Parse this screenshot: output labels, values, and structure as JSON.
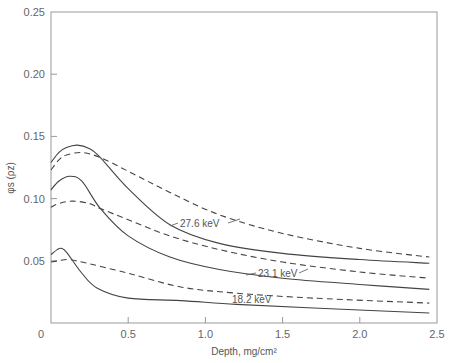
{
  "chart_data": {
    "type": "line",
    "title": "",
    "xlabel": "Depth, mg/cm²",
    "ylabel": "φs (ρz)",
    "xlim": [
      0,
      2.5
    ],
    "ylim": [
      0,
      0.25
    ],
    "xticks": [
      "0",
      "0.5",
      "1.0",
      "1.5",
      "2.0",
      "2.5"
    ],
    "yticks": [
      "0.05",
      "0.10",
      "0.15",
      "0.20",
      "0.25"
    ],
    "grid": false,
    "legend": "inline curve labels",
    "annotations": [
      "27.6 keV",
      "23.1 keV",
      "18.2 keV"
    ],
    "series": [
      {
        "name": "27.6 keV (solid)",
        "style": "solid",
        "x": [
          0,
          0.05,
          0.1,
          0.17,
          0.25,
          0.32,
          0.5,
          0.77,
          1.09,
          1.5,
          2.0,
          2.45
        ],
        "y": [
          0.129,
          0.137,
          0.141,
          0.143,
          0.14,
          0.133,
          0.108,
          0.079,
          0.064,
          0.056,
          0.051,
          0.048
        ]
      },
      {
        "name": "27.6 keV (dashed)",
        "style": "dashed",
        "x": [
          0,
          0.05,
          0.1,
          0.2,
          0.32,
          0.5,
          0.77,
          1.09,
          1.5,
          2.0,
          2.45
        ],
        "y": [
          0.123,
          0.131,
          0.135,
          0.137,
          0.133,
          0.122,
          0.105,
          0.087,
          0.072,
          0.06,
          0.053
        ]
      },
      {
        "name": "23.1 keV (solid)",
        "style": "solid",
        "x": [
          0,
          0.05,
          0.12,
          0.2,
          0.32,
          0.5,
          0.77,
          1.09,
          1.5,
          2.0,
          2.45
        ],
        "y": [
          0.107,
          0.114,
          0.118,
          0.114,
          0.092,
          0.07,
          0.053,
          0.043,
          0.036,
          0.031,
          0.027
        ]
      },
      {
        "name": "23.1 keV (dashed)",
        "style": "dashed",
        "x": [
          0,
          0.05,
          0.14,
          0.25,
          0.32,
          0.5,
          0.77,
          1.09,
          1.5,
          2.0,
          2.45
        ],
        "y": [
          0.093,
          0.096,
          0.098,
          0.096,
          0.092,
          0.083,
          0.07,
          0.059,
          0.049,
          0.041,
          0.036
        ]
      },
      {
        "name": "18.2 keV (solid)",
        "style": "solid",
        "x": [
          0,
          0.04,
          0.065,
          0.1,
          0.2,
          0.3,
          0.5,
          0.84,
          1.2,
          1.7,
          2.45
        ],
        "y": [
          0.055,
          0.059,
          0.06,
          0.057,
          0.04,
          0.028,
          0.02,
          0.018,
          0.015,
          0.012,
          0.008
        ]
      },
      {
        "name": "18.2 keV (dashed)",
        "style": "dashed",
        "x": [
          0,
          0.05,
          0.11,
          0.2,
          0.5,
          0.84,
          1.2,
          1.7,
          2.45
        ],
        "y": [
          0.049,
          0.05,
          0.051,
          0.049,
          0.04,
          0.029,
          0.024,
          0.02,
          0.016
        ]
      }
    ]
  }
}
